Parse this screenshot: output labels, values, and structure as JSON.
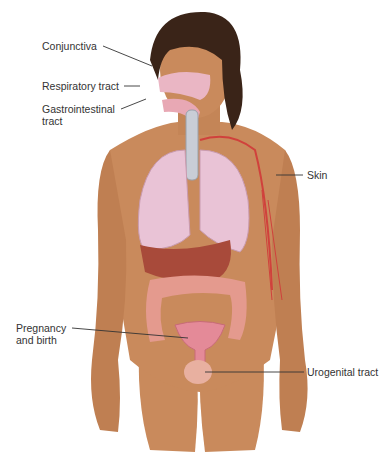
{
  "figure": {
    "colors": {
      "skin": "#c98a5c",
      "skin_dark": "#a8683f",
      "hair": "#3a2418",
      "lung": "#e9c3d6",
      "liver": "#a84a3a",
      "intestine": "#e49a8e",
      "vessel": "#d0413c",
      "uterus": "#e48a98",
      "leader_line": "#333333",
      "label_text": "#333333"
    }
  },
  "labels": {
    "conjunctiva": "Conjunctiva",
    "respiratory": "Respiratory tract",
    "gastro_line1": "Gastrointestinal",
    "gastro_line2": "tract",
    "skin": "Skin",
    "pregnancy_line1": "Pregnancy",
    "pregnancy_line2": "and birth",
    "urogenital": "Urogenital tract"
  }
}
